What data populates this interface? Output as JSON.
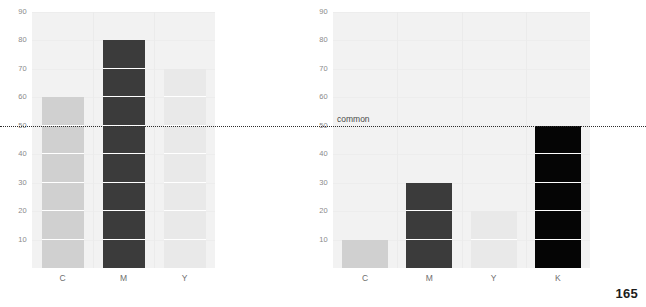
{
  "page": {
    "page_number": "165",
    "background_color": "#ffffff",
    "plot_background_color": "#f2f2f2"
  },
  "annotation": {
    "common_label": "common",
    "common_value": 50,
    "line_color": "#2e2e2e",
    "line_style": "dotted"
  },
  "chart_data": [
    {
      "id": "left",
      "type": "bar",
      "title": "",
      "xlabel": "",
      "ylabel": "",
      "categories": [
        "C",
        "M",
        "Y"
      ],
      "values": [
        60,
        80,
        70
      ],
      "colors": [
        "#d0d0d0",
        "#3b3b3b",
        "#e9e9e9"
      ],
      "ylim": [
        0,
        90
      ],
      "yticks": [
        90,
        80,
        70,
        60,
        50,
        40,
        30,
        20,
        10
      ],
      "ytick_labels": [
        "90",
        "80",
        "70",
        "60",
        "50",
        "40",
        "30",
        "20",
        "10"
      ],
      "grid": true,
      "legend": "none",
      "segment_step": 10,
      "annotations": [
        {
          "type": "hline",
          "value": 50,
          "style": "dotted",
          "label": ""
        }
      ]
    },
    {
      "id": "right",
      "type": "bar",
      "title": "",
      "xlabel": "",
      "ylabel": "",
      "categories": [
        "C",
        "M",
        "Y",
        "K"
      ],
      "values": [
        10,
        30,
        20,
        50
      ],
      "colors": [
        "#d0d0d0",
        "#3b3b3b",
        "#e9e9e9",
        "#050505"
      ],
      "ylim": [
        0,
        90
      ],
      "yticks": [
        90,
        80,
        70,
        60,
        50,
        40,
        30,
        20,
        10
      ],
      "ytick_labels": [
        "90",
        "80",
        "70",
        "60",
        "50",
        "40",
        "30",
        "20",
        "10"
      ],
      "grid": true,
      "legend": "none",
      "segment_step": 10,
      "annotations": [
        {
          "type": "hline",
          "value": 50,
          "style": "dotted",
          "label": "common"
        }
      ]
    }
  ]
}
